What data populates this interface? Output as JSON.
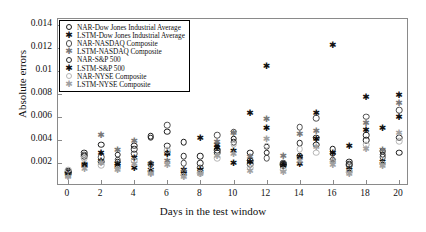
{
  "chart_data": {
    "type": "scatter",
    "title": "",
    "xlabel": "Days in the test window",
    "ylabel": "Absolute errors",
    "xlim": [
      -0.6,
      20.6
    ],
    "ylim": [
      0,
      0.0145
    ],
    "xticks": [
      0,
      2,
      4,
      6,
      8,
      10,
      12,
      14,
      16,
      18,
      20
    ],
    "xticklabels": [
      "0",
      "2",
      "4",
      "6",
      "8",
      "10",
      "12",
      "14",
      "16",
      "18",
      "20"
    ],
    "yticks": [
      0.002,
      0.004,
      0.006,
      0.008,
      0.01,
      0.012,
      0.014
    ],
    "yticklabels": [
      "0.002",
      "0.004",
      "0.006",
      "0.008",
      "0.01",
      "0.012",
      "0.014"
    ],
    "grid": false,
    "legend_position": "upper left",
    "x": [
      0,
      1,
      2,
      3,
      4,
      5,
      6,
      7,
      8,
      9,
      10,
      11,
      12,
      13,
      14,
      15,
      16,
      17,
      18,
      19,
      20
    ],
    "series": [
      {
        "name": "NAR-Dow Jones Industrial Average",
        "marker": "circle-open",
        "color": "#1a1a1a",
        "values": [
          0.0011,
          0.0029,
          0.0036,
          0.0021,
          0.0035,
          0.0043,
          0.0047,
          0.0038,
          0.0026,
          0.0031,
          0.0041,
          0.0029,
          0.0034,
          0.0019,
          0.0026,
          0.0036,
          0.0032,
          0.0021,
          0.004,
          0.003,
          0.0029
        ]
      },
      {
        "name": "LSTM-Dow Jones Industrial Average",
        "marker": "star",
        "color": "#111111",
        "values": [
          0.001,
          0.0017,
          0.0022,
          0.0019,
          0.0016,
          0.0019,
          0.0029,
          0.0014,
          0.0042,
          0.0036,
          0.002,
          0.0063,
          0.0104,
          0.0019,
          0.0025,
          0.0063,
          0.0122,
          0.0035,
          0.0077,
          0.005,
          0.0079
        ]
      },
      {
        "name": "NAR-NASDAQ Composite",
        "marker": "circle-open",
        "color": "#4d4d4d",
        "values": [
          0.0012,
          0.0027,
          0.0025,
          0.0023,
          0.0028,
          0.0019,
          0.0053,
          0.002,
          0.0016,
          0.0044,
          0.0047,
          0.0019,
          0.0024,
          0.002,
          0.0051,
          0.0059,
          0.0023,
          0.0018,
          0.006,
          0.0025,
          0.0066
        ]
      },
      {
        "name": "LSTM-NASDAQ Composite",
        "marker": "star",
        "color": "#787878",
        "values": [
          0.0009,
          0.0019,
          0.0044,
          0.0031,
          0.0039,
          0.0011,
          0.0022,
          0.0012,
          0.0012,
          0.0038,
          0.0046,
          0.0025,
          0.0058,
          0.0026,
          0.0045,
          0.0048,
          0.0022,
          0.0016,
          0.0055,
          0.0031,
          0.0072
        ]
      },
      {
        "name": "NAR-S&P 500",
        "marker": "circle-open",
        "color": "#2b2b2b",
        "values": [
          0.0013,
          0.0026,
          0.0021,
          0.0027,
          0.0032,
          0.0042,
          0.0035,
          0.0026,
          0.002,
          0.0029,
          0.0038,
          0.0022,
          0.0029,
          0.0018,
          0.0037,
          0.0042,
          0.0028,
          0.0019,
          0.0044,
          0.0027,
          0.0042
        ]
      },
      {
        "name": "LSTM-S&P 500",
        "marker": "star",
        "color": "#0d0d0d",
        "values": [
          0.001,
          0.0018,
          0.0029,
          0.0017,
          0.0024,
          0.0014,
          0.0028,
          0.001,
          0.0014,
          0.0033,
          0.003,
          0.0021,
          0.005,
          0.0017,
          0.0019,
          0.0041,
          0.0029,
          0.0014,
          0.0049,
          0.0021,
          0.006
        ]
      },
      {
        "name": "NAR-NYSE Composite",
        "marker": "circle-open",
        "color": "#b5b5b5",
        "values": [
          0.0014,
          0.0024,
          0.0018,
          0.0015,
          0.0022,
          0.0013,
          0.0031,
          0.0009,
          0.0011,
          0.0024,
          0.0036,
          0.0016,
          0.0035,
          0.0014,
          0.0032,
          0.0029,
          0.0021,
          0.0012,
          0.0036,
          0.0019,
          0.0039
        ]
      },
      {
        "name": "LSTM-NYSE Composite",
        "marker": "star",
        "color": "#a0a0a0",
        "values": [
          0.0008,
          0.0015,
          0.002,
          0.0014,
          0.0019,
          0.001,
          0.0018,
          0.0008,
          0.001,
          0.0026,
          0.0028,
          0.0013,
          0.0041,
          0.0012,
          0.0022,
          0.0034,
          0.0018,
          0.001,
          0.0032,
          0.0017,
          0.0046
        ]
      }
    ]
  },
  "legend": {
    "items": [
      {
        "label": "NAR-Dow Jones Industrial Average",
        "marker": "circle-open",
        "color": "#1a1a1a"
      },
      {
        "label": "LSTM-Dow Jones Industrial Average",
        "marker": "star",
        "color": "#111111"
      },
      {
        "label": "NAR-NASDAQ Composite",
        "marker": "circle-open",
        "color": "#4d4d4d"
      },
      {
        "label": "LSTM-NASDAQ Composite",
        "marker": "star",
        "color": "#787878"
      },
      {
        "label": "NAR-S&P 500",
        "marker": "circle-open",
        "color": "#2b2b2b"
      },
      {
        "label": "LSTM-S&P 500",
        "marker": "star",
        "color": "#0d0d0d"
      },
      {
        "label": "NAR-NYSE Composite",
        "marker": "circle-open",
        "color": "#b5b5b5"
      },
      {
        "label": "LSTM-NYSE Composite",
        "marker": "star",
        "color": "#a0a0a0"
      }
    ]
  }
}
